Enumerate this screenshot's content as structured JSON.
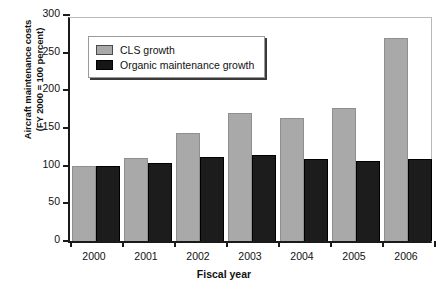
{
  "chart_data": {
    "type": "bar",
    "title": "",
    "xlabel": "Fiscal year",
    "ylabel": "Aircraft maintenance costs (FY 2000 = 100 percent)",
    "ylabel_line1": "Aircraft maintenance costs",
    "ylabel_line2": "(FY 2000 = 100 percent)",
    "categories": [
      "2000",
      "2001",
      "2002",
      "2003",
      "2004",
      "2005",
      "2006"
    ],
    "series": [
      {
        "name": "CLS growth",
        "color": "#a9a9a9",
        "values": [
          100,
          110,
          143,
          170,
          163,
          177,
          270
        ]
      },
      {
        "name": "Organic maintenance growth",
        "color": "#1c1c1c",
        "values": [
          100,
          103,
          112,
          114,
          109,
          106,
          109
        ]
      }
    ],
    "ylim": [
      0,
      300
    ],
    "yticks": [
      0,
      50,
      100,
      150,
      200,
      250,
      300
    ],
    "ytick_labels": [
      "0",
      "50",
      "100",
      "150",
      "200",
      "250",
      "300"
    ],
    "grid": false,
    "legend_position": "top-left-inside"
  }
}
